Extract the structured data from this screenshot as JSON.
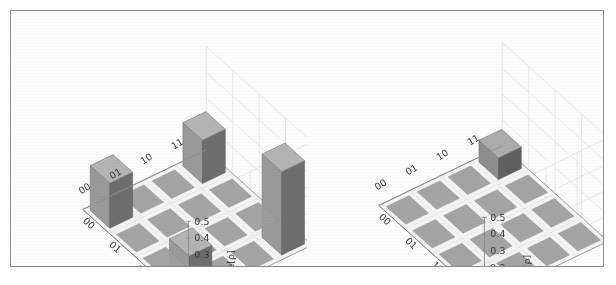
{
  "figure": {
    "border_color": "#8c8c8c",
    "background": "#fdfdfd",
    "panels": [
      "Re[ρ]",
      "Im[ρ]"
    ]
  },
  "chart_data": [
    {
      "type": "bar",
      "subtype": "bar3d",
      "title": "",
      "zlabel": "Re[ρ]",
      "xlabel": "",
      "ylabel": "",
      "categories_x": [
        "00",
        "01",
        "10",
        "11"
      ],
      "categories_y": [
        "00",
        "01",
        "10",
        "11"
      ],
      "zticks": [
        "0.0",
        "0.1",
        "0.2",
        "0.3",
        "0.4",
        "0.5"
      ],
      "zlim": [
        0.0,
        0.5
      ],
      "grid": true,
      "legend": "none",
      "bar_color": "#9a9a9a",
      "bar_side_color": "#6e6e6e",
      "bar_top_color": "#b4b4b4",
      "matrix": [
        [
          0.27,
          0.0,
          0.0,
          0.26
        ],
        [
          0.0,
          0.0,
          0.0,
          0.0
        ],
        [
          0.0,
          0.0,
          0.0,
          0.0
        ],
        [
          0.26,
          0.0,
          0.0,
          0.5
        ]
      ],
      "row_labels": [
        "00",
        "01",
        "10",
        "11"
      ],
      "col_labels": [
        "00",
        "01",
        "10",
        "11"
      ],
      "nonzero_bars": [
        {
          "row": "00",
          "col": "00",
          "value": 0.27
        },
        {
          "row": "00",
          "col": "11",
          "value": 0.26
        },
        {
          "row": "11",
          "col": "00",
          "value": 0.26
        },
        {
          "row": "11",
          "col": "11",
          "value": 0.5
        }
      ]
    },
    {
      "type": "bar",
      "subtype": "bar3d",
      "title": "",
      "zlabel": "Im[ρ]",
      "xlabel": "",
      "ylabel": "",
      "categories_x": [
        "00",
        "01",
        "10",
        "11"
      ],
      "categories_y": [
        "00",
        "01",
        "10",
        "11"
      ],
      "zticks": [
        "-0.1",
        "0.0",
        "0.1",
        "0.2",
        "0.3",
        "0.4",
        "0.5"
      ],
      "zlim": [
        -0.1,
        0.5
      ],
      "grid": true,
      "legend": "none",
      "bar_color": "#8e8e8e",
      "bar_side_color": "#5f5f5f",
      "bar_top_color": "#ababab",
      "matrix": [
        [
          0.0,
          0.0,
          0.0,
          0.13
        ],
        [
          0.0,
          0.0,
          0.0,
          0.0
        ],
        [
          0.0,
          0.0,
          0.0,
          0.0
        ],
        [
          -0.13,
          0.0,
          0.0,
          0.0
        ]
      ],
      "row_labels": [
        "00",
        "01",
        "10",
        "11"
      ],
      "col_labels": [
        "00",
        "01",
        "10",
        "11"
      ],
      "nonzero_bars": [
        {
          "row": "00",
          "col": "11",
          "value": 0.13
        },
        {
          "row": "11",
          "col": "00",
          "value": -0.13
        }
      ]
    }
  ]
}
